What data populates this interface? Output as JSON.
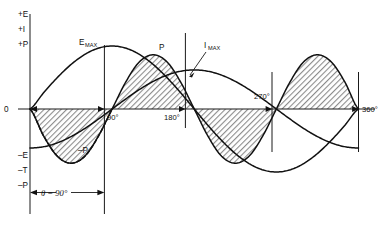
{
  "figure": {
    "background_color": "#ffffff",
    "curve_color": "#111111",
    "fill_color": "#9a9a9a"
  },
  "labels": {
    "axis_pos_e": "+E",
    "axis_pos_i": "+I",
    "axis_pos_p": "+P",
    "axis_neg_e": "–E",
    "axis_neg_t": "–T",
    "axis_neg_p": "–P",
    "origin": "0",
    "e_max_main": "E",
    "e_max_sub": "MAX",
    "i_max_main": "I",
    "i_max_sub": "MAX",
    "p_positive": "P",
    "p_negative": "–P",
    "theta": "θ = 90°"
  },
  "ticks": {
    "deg_90": "90°",
    "deg_180": "180°",
    "deg_270": "270°",
    "deg_360": "360°"
  },
  "chart_data": {
    "type": "line",
    "xlabel": "",
    "ylabel": "",
    "xlim": [
      0,
      360
    ],
    "ylim": [
      -1.05,
      1.05
    ],
    "grid": false,
    "legend": "inline-annotations",
    "x_tick_labels": [
      "0",
      "90°",
      "180°",
      "270°",
      "360°"
    ],
    "x_tick_values": [
      0,
      90,
      180,
      270,
      360
    ],
    "y_tick_labels_positive": [
      "+E",
      "+I",
      "+P"
    ],
    "y_tick_labels_negative": [
      "–E",
      "–T",
      "–P"
    ],
    "phase_angle_degrees": 90,
    "annotations": [
      {
        "text": "E_MAX",
        "x": 90,
        "y": 1.0,
        "note": "voltage peak"
      },
      {
        "text": "I_MAX",
        "x": 180,
        "y": 0.62,
        "note": "current peak"
      },
      {
        "text": "P",
        "x": 135,
        "y": 1.0,
        "note": "positive power lobe"
      },
      {
        "text": "–P",
        "x": 60,
        "y": -0.62,
        "note": "negative power lobe"
      },
      {
        "text": "θ = 90°",
        "x": 45,
        "y": -1.0,
        "note": "phase displacement between E and I"
      }
    ],
    "series": [
      {
        "name": "E",
        "label": "Voltage",
        "style": "solid",
        "formula": "sin(x)",
        "x": [
          0,
          15,
          30,
          45,
          60,
          75,
          90,
          105,
          120,
          135,
          150,
          165,
          180,
          195,
          210,
          225,
          240,
          255,
          270,
          285,
          300,
          315,
          330,
          345,
          360
        ],
        "values": [
          0,
          0.259,
          0.5,
          0.707,
          0.866,
          0.966,
          1.0,
          0.966,
          0.866,
          0.707,
          0.5,
          0.259,
          0,
          -0.259,
          -0.5,
          -0.707,
          -0.866,
          -0.966,
          -1.0,
          -0.966,
          -0.866,
          -0.707,
          -0.5,
          -0.259,
          0
        ]
      },
      {
        "name": "I",
        "label": "Current (lagging 90°)",
        "style": "solid",
        "formula": "-cos(x)",
        "x": [
          0,
          15,
          30,
          45,
          60,
          75,
          90,
          105,
          120,
          135,
          150,
          165,
          180,
          195,
          210,
          225,
          240,
          255,
          270,
          285,
          300,
          315,
          330,
          345,
          360
        ],
        "values": [
          -0.62,
          -0.599,
          -0.537,
          -0.438,
          -0.31,
          -0.16,
          0,
          0.16,
          0.31,
          0.438,
          0.537,
          0.599,
          0.62,
          0.599,
          0.537,
          0.438,
          0.31,
          0.16,
          0,
          -0.16,
          -0.31,
          -0.438,
          -0.537,
          -0.599,
          -0.62
        ]
      },
      {
        "name": "P",
        "label": "Instantaneous power (E × I)",
        "style": "solid-with-dashed-first-quarter",
        "formula": "-0.5 * sin(2x)",
        "fill_to_zero": true,
        "x": [
          0,
          15,
          30,
          45,
          60,
          75,
          90,
          105,
          120,
          135,
          150,
          165,
          180,
          195,
          210,
          225,
          240,
          255,
          270,
          285,
          300,
          315,
          330,
          345,
          360
        ],
        "values": [
          0,
          -0.43,
          -0.75,
          -0.86,
          -0.75,
          -0.43,
          0,
          0.43,
          0.75,
          0.86,
          0.75,
          0.43,
          0,
          -0.43,
          -0.75,
          -0.86,
          -0.75,
          -0.43,
          0,
          0.43,
          0.75,
          0.86,
          0.75,
          0.43,
          0
        ]
      }
    ]
  }
}
